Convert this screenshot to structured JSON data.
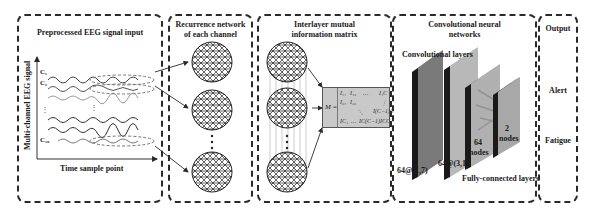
{
  "panels": {
    "eeg_input": {
      "title": "Preprocessed EEG signal input",
      "y_axis_label": "Multi-channel EEG signal",
      "x_axis_label": "Time sample point",
      "channels": [
        "C₁",
        "C₂",
        "C₃₀"
      ]
    },
    "recurrence": {
      "title_line1": "Recurrence network",
      "title_line2": "of each channel"
    },
    "mutual_info": {
      "title_line1": "Interlayer mutual",
      "title_line2": "information matrix",
      "matrix_label": "M =",
      "matrix_cells": {
        "r1c1": "I₁₁",
        "r1c2": "I₁₂",
        "r1dots": "…",
        "r1cn": "I₁C",
        "r2c1": "I₂₁",
        "r2c2": "I₂₂",
        "r2vdots": "⋮",
        "r3ddots": "⋱",
        "r3cn": "I(C−1)C",
        "r4c1": "IC₁",
        "r4dots": "…",
        "r4cn1": "IC(C−1)",
        "r4cn": "ICC"
      }
    },
    "cnn": {
      "title_line1": "Convolutional neural",
      "title_line2": "networks",
      "conv_label": "Convolutional layers",
      "layer1_label": "64@(1,7)",
      "layer2_label": "64@(3,1)",
      "fc1_label_line1": "64",
      "fc1_label_line2": "nodes",
      "fc2_label_line1": "2",
      "fc2_label_line2": "nodes",
      "fc_label": "Fully-connected layers"
    },
    "output": {
      "title": "Output",
      "classes": [
        "Alert",
        "Fatigue"
      ]
    }
  },
  "colors": {
    "border": "#2a2a2a",
    "layer_dark": "#7a7a7a",
    "layer_light": "#b8b8b8",
    "layer_edge": "#1a1a1a",
    "matrix_bg": "#c9c9c9"
  }
}
